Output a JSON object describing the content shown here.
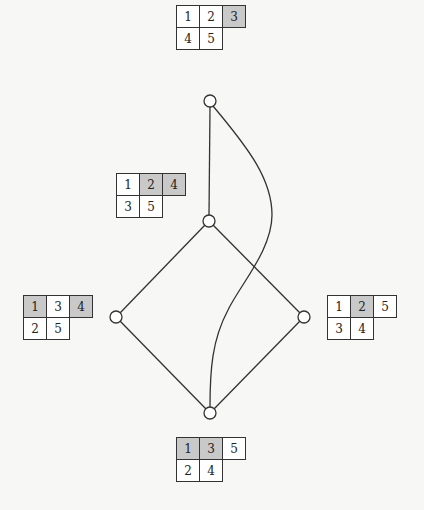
{
  "diagram": {
    "colors": {
      "background": "#f7f7f5",
      "shaded_cell": "#c9c9c9",
      "stroke": "#333333"
    },
    "nodes": [
      {
        "id": "top",
        "x": 210,
        "y": 101
      },
      {
        "id": "middle",
        "x": 209,
        "y": 221
      },
      {
        "id": "left",
        "x": 116,
        "y": 317
      },
      {
        "id": "right",
        "x": 304,
        "y": 317
      },
      {
        "id": "bottom",
        "x": 210,
        "y": 413
      }
    ],
    "edges": [
      {
        "from": "top",
        "to": "middle",
        "type": "straight"
      },
      {
        "from": "middle",
        "to": "left",
        "type": "straight"
      },
      {
        "from": "middle",
        "to": "right",
        "type": "straight"
      },
      {
        "from": "left",
        "to": "bottom",
        "type": "straight"
      },
      {
        "from": "right",
        "to": "bottom",
        "type": "straight"
      },
      {
        "from": "top",
        "to": "bottom",
        "type": "curve"
      }
    ],
    "tableaux": [
      {
        "id": "tableau-top",
        "attached_to": "top",
        "row1": [
          {
            "v": "1",
            "s": false
          },
          {
            "v": "2",
            "s": false
          },
          {
            "v": "3",
            "s": true
          }
        ],
        "row2": [
          {
            "v": "4",
            "s": false
          },
          {
            "v": "5",
            "s": false
          }
        ]
      },
      {
        "id": "tableau-middle",
        "attached_to": "middle",
        "row1": [
          {
            "v": "1",
            "s": false
          },
          {
            "v": "2",
            "s": true
          },
          {
            "v": "4",
            "s": true
          }
        ],
        "row2": [
          {
            "v": "3",
            "s": false
          },
          {
            "v": "5",
            "s": false
          }
        ]
      },
      {
        "id": "tableau-left",
        "attached_to": "left",
        "row1": [
          {
            "v": "1",
            "s": true
          },
          {
            "v": "3",
            "s": false
          },
          {
            "v": "4",
            "s": true
          }
        ],
        "row2": [
          {
            "v": "2",
            "s": false
          },
          {
            "v": "5",
            "s": false
          }
        ]
      },
      {
        "id": "tableau-right",
        "attached_to": "right",
        "row1": [
          {
            "v": "1",
            "s": false
          },
          {
            "v": "2",
            "s": true
          },
          {
            "v": "5",
            "s": false
          }
        ],
        "row2": [
          {
            "v": "3",
            "s": false
          },
          {
            "v": "4",
            "s": false
          }
        ]
      },
      {
        "id": "tableau-bottom",
        "attached_to": "bottom",
        "row1": [
          {
            "v": "1",
            "s": true
          },
          {
            "v": "3",
            "s": true
          },
          {
            "v": "5",
            "s": false
          }
        ],
        "row2": [
          {
            "v": "2",
            "s": false
          },
          {
            "v": "4",
            "s": false
          }
        ]
      }
    ]
  },
  "t": {
    "top": {
      "r1c1": "1",
      "r1c2": "2",
      "r1c3": "3",
      "r2c1": "4",
      "r2c2": "5"
    },
    "middle": {
      "r1c1": "1",
      "r1c2": "2",
      "r1c3": "4",
      "r2c1": "3",
      "r2c2": "5"
    },
    "left": {
      "r1c1": "1",
      "r1c2": "3",
      "r1c3": "4",
      "r2c1": "2",
      "r2c2": "5"
    },
    "right": {
      "r1c1": "1",
      "r1c2": "2",
      "r1c3": "5",
      "r2c1": "3",
      "r2c2": "4"
    },
    "bottom": {
      "r1c1": "1",
      "r1c2": "3",
      "r1c3": "5",
      "r2c1": "2",
      "r2c2": "4"
    }
  }
}
